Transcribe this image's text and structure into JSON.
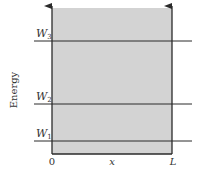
{
  "diagram": {
    "type": "energy-level-diagram",
    "y_axis_label": "Energy",
    "x_axis_label": "x",
    "x_ticks": {
      "left": "0",
      "right": "L"
    },
    "levels": [
      {
        "name": "W",
        "subscript": "3",
        "order": 3
      },
      {
        "name": "W",
        "subscript": "2",
        "order": 2
      },
      {
        "name": "W",
        "subscript": "1",
        "order": 1
      }
    ],
    "colors": {
      "well_fill": "#d3d3d3",
      "line": "#2a2a2a",
      "text": "#333333",
      "background": "#ffffff"
    }
  }
}
